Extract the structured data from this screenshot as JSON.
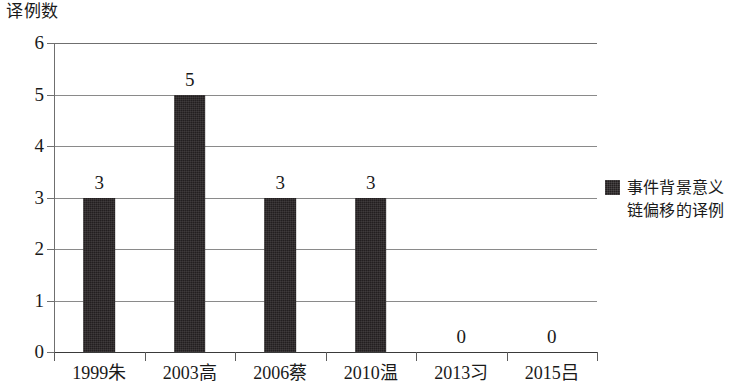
{
  "chart_data": {
    "type": "bar",
    "title": "",
    "ylabel": "译例数",
    "xlabel": "",
    "categories": [
      "1999朱",
      "2003高",
      "2006蔡",
      "2010温",
      "2013习",
      "2015吕"
    ],
    "values": [
      3,
      5,
      3,
      3,
      0,
      0
    ],
    "value_labels": [
      "3",
      "5",
      "3",
      "3",
      "0",
      "0"
    ],
    "ylim": [
      0,
      6
    ],
    "y_ticks": [
      0,
      1,
      2,
      3,
      4,
      5,
      6
    ],
    "y_tick_labels": [
      "0",
      "1",
      "2",
      "3",
      "4",
      "5",
      "6"
    ],
    "grid": true,
    "legend_position": "right",
    "series": [
      {
        "name": "事件背景意义链偏移的译例",
        "color": "#231f20",
        "values": [
          3,
          5,
          3,
          3,
          0,
          0
        ]
      }
    ]
  },
  "legend": {
    "swatch_name": "legend-color-swatch",
    "label": "事件背景意义链偏移的译例"
  },
  "colors": {
    "bar": "#231f20",
    "gridline": "#8a8a8a",
    "axis": "#3a3a3a",
    "background": "#ffffff",
    "text": "#1a1a1a"
  }
}
